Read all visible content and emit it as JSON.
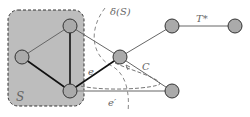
{
  "diagram": {
    "labels": {
      "set": "S",
      "cut": "δ(S)",
      "tree": "T*",
      "cycle": "C",
      "edge_e": "e",
      "edge_e_prime": "e′"
    },
    "nodes": [
      {
        "id": "a",
        "x": 70,
        "y": 26
      },
      {
        "id": "b",
        "x": 22,
        "y": 57
      },
      {
        "id": "c",
        "x": 70,
        "y": 91
      },
      {
        "id": "d",
        "x": 120,
        "y": 57
      },
      {
        "id": "e",
        "x": 172,
        "y": 26
      },
      {
        "id": "f",
        "x": 235,
        "y": 26
      },
      {
        "id": "g",
        "x": 172,
        "y": 91
      }
    ],
    "colors": {
      "node_fill": "#aaaaaa",
      "set_fill": "#bdbdbd",
      "edge": "#555555",
      "dashed": "#888888"
    }
  }
}
